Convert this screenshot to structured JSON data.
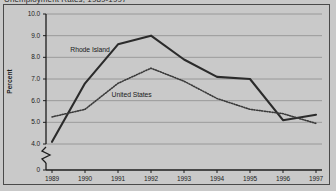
{
  "clipped_title": "Unemployment Rates, 1989-1997",
  "chart_data": {
    "type": "line",
    "title": "",
    "xlabel": "",
    "ylabel": "Percent",
    "x": [
      "1989",
      "1990",
      "1991",
      "1992",
      "1993",
      "1994",
      "1995",
      "1996",
      "1997"
    ],
    "categories": [
      "1989",
      "1990",
      "1991",
      "1992",
      "1993",
      "1994",
      "1995",
      "1996",
      "1997"
    ],
    "series": [
      {
        "name": "Rhode Island",
        "style": "solid",
        "color": "#2b2b2b",
        "values": [
          4.1,
          6.8,
          8.6,
          9.0,
          7.9,
          7.1,
          7.0,
          5.1,
          5.35
        ]
      },
      {
        "name": "United States",
        "style": "dotted",
        "color": "#3a3a3a",
        "values": [
          5.25,
          5.6,
          6.8,
          7.5,
          6.9,
          6.1,
          5.6,
          5.4,
          4.95
        ]
      }
    ],
    "ylim": [
      4.0,
      10.0
    ],
    "yticks": [
      "10.0",
      "9.0",
      "8.0",
      "7.0",
      "6.0",
      "5.0",
      "4.0",
      "0"
    ],
    "ytick_values": [
      10.0,
      9.0,
      8.0,
      7.0,
      6.0,
      5.0,
      4.0,
      0
    ],
    "axis_break": true,
    "grid": true,
    "legend_position": "inline-annotations",
    "annotations": [
      {
        "text": "Rhode Island",
        "x": 1990.1,
        "y": 8.32
      },
      {
        "text": "United States",
        "x": 1991.35,
        "y": 6.27
      }
    ],
    "colors": {
      "background": "#c9c9c9",
      "plot_background": "#c9c9c9",
      "gridline": "#8e8e8e",
      "axis": "#1d1d1d",
      "border": "#4a4a4a"
    }
  }
}
